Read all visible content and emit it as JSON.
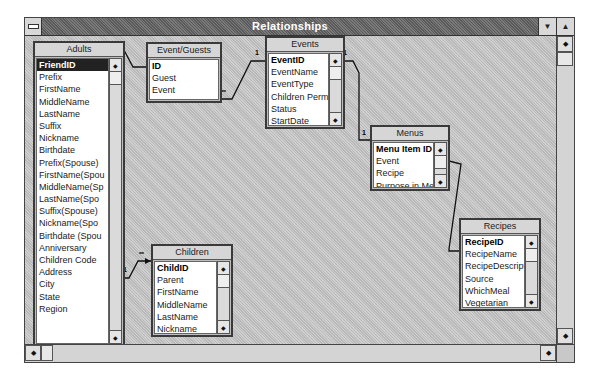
{
  "window": {
    "title": "Relationships",
    "buttons": {
      "minimize": "▼",
      "maximize": "▲"
    }
  },
  "tables": {
    "adults": {
      "title": "Adults",
      "fields": [
        "FriendID",
        "Prefix",
        "FirstName",
        "MiddleName",
        "LastName",
        "Suffix",
        "Nickname",
        "Birthdate",
        "Prefix(Spouse)",
        "FirstName(Spou",
        "MiddleName(Sp",
        "LastName(Spo",
        "Suffix(Spouse)",
        "Nickname(Spo",
        "Birthdate (Spou",
        "Anniversary",
        "Children Code",
        "Address",
        "City",
        "State",
        "Region"
      ]
    },
    "event_guests": {
      "title": "Event/Guests",
      "fields": [
        "ID",
        "Guest",
        "Event"
      ]
    },
    "events": {
      "title": "Events",
      "fields": [
        "EventID",
        "EventName",
        "EventType",
        "Children Permitt",
        "Status",
        "StartDate"
      ]
    },
    "menus": {
      "title": "Menus",
      "fields": [
        "Menu Item ID",
        "Event",
        "Recipe",
        "Purpose in Mea"
      ]
    },
    "recipes": {
      "title": "Recipes",
      "fields": [
        "RecipeID",
        "RecipeName",
        "RecipeDescript",
        "Source",
        "WhichMeal",
        "Vegetarian"
      ]
    },
    "children": {
      "title": "Children",
      "fields": [
        "ChildID",
        "Parent",
        "FirstName",
        "MiddleName",
        "LastName",
        "Nickname"
      ]
    }
  },
  "relationships": [
    {
      "from": "Adults.FriendID",
      "to": "Event/Guests.Guest",
      "from_card": "",
      "to_card": ""
    },
    {
      "from": "Events.EventID",
      "to": "Event/Guests.Event",
      "from_card": "1",
      "to_card": "∞"
    },
    {
      "from": "Events.EventID",
      "to": "Menus.Event",
      "from_card": "1",
      "to_card": "1"
    },
    {
      "from": "Menus.Recipe",
      "to": "Recipes.RecipeID",
      "from_card": "",
      "to_card": ""
    },
    {
      "from": "Adults.Children Code",
      "to": "Children.Parent",
      "from_card": "1",
      "to_card": "∞"
    }
  ],
  "scroll_glyphs": {
    "up": "▲",
    "down": "▼",
    "left": "◄",
    "right": "►",
    "dot": "◆"
  }
}
